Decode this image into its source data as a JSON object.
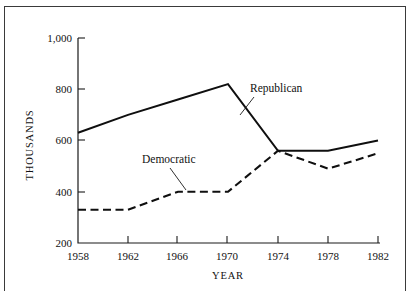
{
  "chart_data": {
    "type": "line",
    "title": "",
    "xlabel": "YEAR",
    "ylabel": "THOUSANDS",
    "x": [
      1958,
      1962,
      1966,
      1970,
      1974,
      1978,
      1982
    ],
    "xticklabels": [
      "1958",
      "1962",
      "1966",
      "1970",
      "1974",
      "1978",
      "1982"
    ],
    "yticklabels": [
      "1,000",
      "800",
      "600",
      "400",
      "200"
    ],
    "ytickvalues": [
      1000,
      800,
      600,
      400,
      200
    ],
    "xlim": [
      1958,
      1982
    ],
    "ylim": [
      200,
      1000
    ],
    "grid": false,
    "legend_position": "inline-annotations",
    "series": [
      {
        "name": "Republican",
        "style": "solid",
        "color": "#0f0f0f",
        "values": [
          630,
          700,
          760,
          820,
          560,
          560,
          600
        ]
      },
      {
        "name": "Democratic",
        "style": "dashed",
        "color": "#0f0f0f",
        "values": [
          330,
          330,
          400,
          400,
          560,
          490,
          550
        ]
      }
    ],
    "annotations": [
      {
        "text": "Republican",
        "points_to_series": "Republican"
      },
      {
        "text": "Democratic",
        "points_to_series": "Democratic"
      }
    ]
  }
}
